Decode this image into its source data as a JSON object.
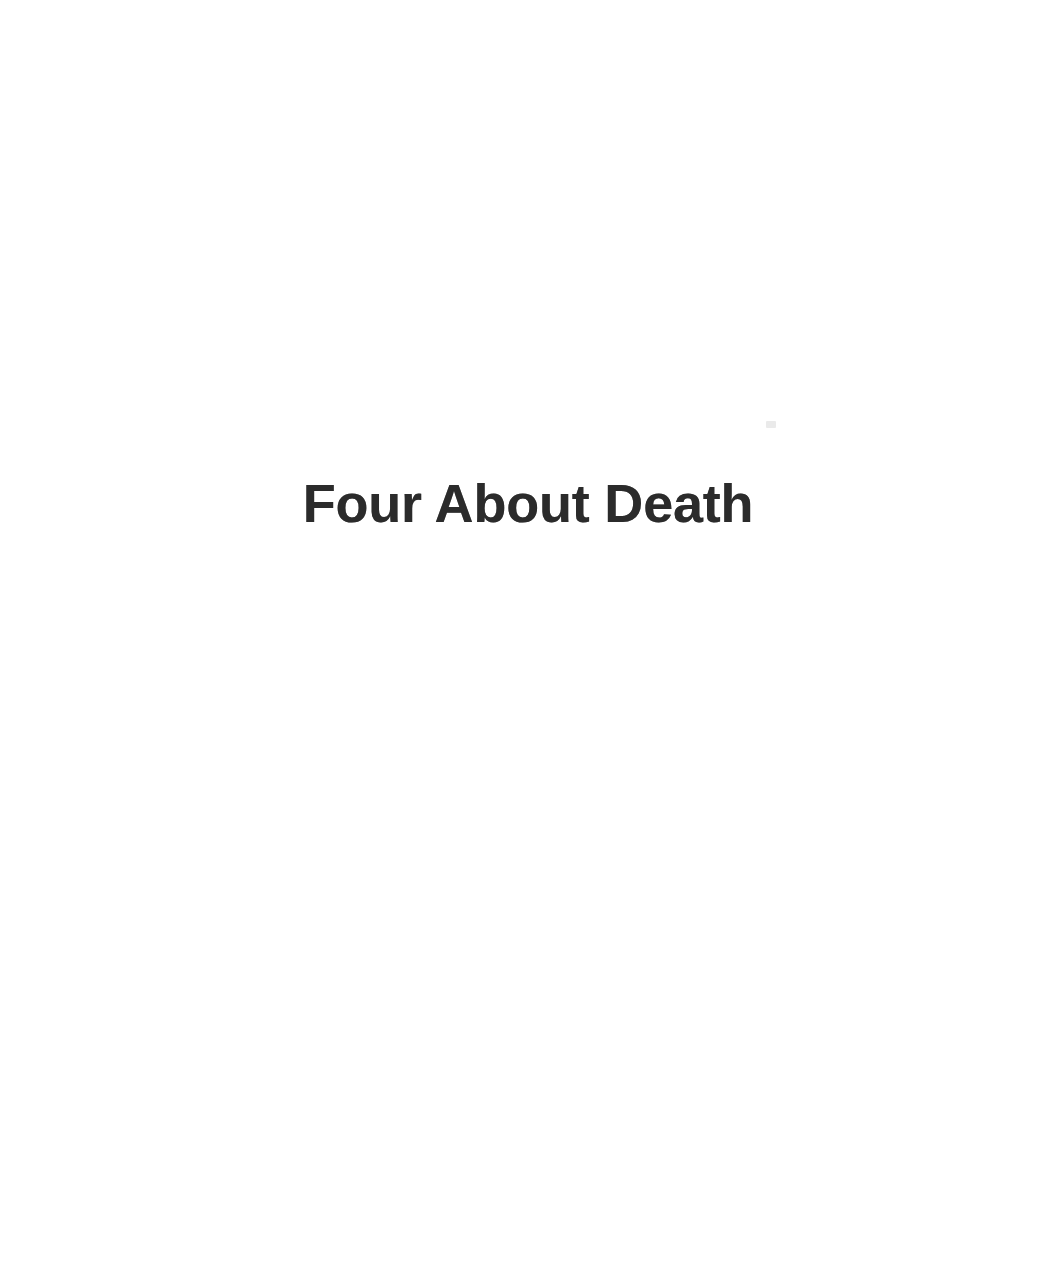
{
  "page": {
    "kind": "scanned-book-section-title-page",
    "background_color": "#ffffff",
    "ink_color": "#2b2b2b",
    "width": 1056,
    "height": 1269
  },
  "content": {
    "section_title": "Four About Death"
  },
  "artifacts": {
    "speck_1_label": ""
  }
}
